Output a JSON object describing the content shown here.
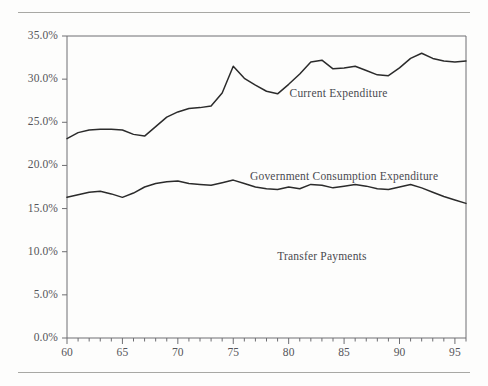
{
  "figure": {
    "background": "#fdfdfc",
    "rule_color": "#a8a8a4",
    "axis_color": "#6e6e72",
    "line_color": "#2b2b2b",
    "tick_label_color": "#55555a"
  },
  "chart_data": {
    "type": "line",
    "title": "",
    "subtitle": "",
    "xlabel": "",
    "ylabel": "",
    "xlim": [
      60,
      96
    ],
    "ylim": [
      0,
      35
    ],
    "grid": false,
    "legend": "inline-annotations",
    "y_tick_labels": [
      "0.0%",
      "5.0%",
      "10.0%",
      "15.0%",
      "20.0%",
      "25.0%",
      "30.0%",
      "35.0%"
    ],
    "y_tick_values": [
      0,
      5,
      10,
      15,
      20,
      25,
      30,
      35
    ],
    "x_tick_labels": [
      "60",
      "65",
      "70",
      "75",
      "80",
      "85",
      "90",
      "95"
    ],
    "x_tick_values": [
      60,
      65,
      70,
      75,
      80,
      85,
      90,
      95
    ],
    "x_minor_tick_step": 1,
    "x": [
      60,
      61,
      62,
      63,
      64,
      65,
      66,
      67,
      68,
      69,
      70,
      71,
      72,
      73,
      74,
      75,
      76,
      77,
      78,
      79,
      80,
      81,
      82,
      83,
      84,
      85,
      86,
      87,
      88,
      89,
      90,
      91,
      92,
      93,
      94,
      95,
      96
    ],
    "annotations": [
      {
        "text": "Current Expenditure",
        "x": 84.5,
        "y": 28.2
      },
      {
        "text": "Government Consumption Expenditure",
        "x": 85.0,
        "y": 18.6
      },
      {
        "text": "Transfer Payments",
        "x": 83.0,
        "y": 9.3
      }
    ],
    "series": [
      {
        "name": "Current Expenditure",
        "values": [
          23.1,
          23.8,
          24.1,
          24.2,
          24.2,
          24.1,
          23.6,
          23.4,
          24.5,
          25.6,
          26.2,
          26.6,
          26.7,
          26.9,
          28.4,
          31.5,
          30.1,
          29.3,
          28.6,
          28.3,
          29.4,
          30.6,
          32.0,
          32.2,
          31.2,
          31.3,
          31.5,
          31.0,
          30.5,
          30.4,
          31.3,
          32.4,
          33.0,
          32.4,
          32.1,
          32.0,
          32.1
        ]
      },
      {
        "name": "Government Consumption Expenditure",
        "values": [
          16.3,
          16.6,
          16.9,
          17.0,
          16.7,
          16.3,
          16.8,
          17.5,
          17.9,
          18.1,
          18.2,
          17.9,
          17.8,
          17.7,
          18.0,
          18.3,
          17.9,
          17.5,
          17.3,
          17.2,
          17.5,
          17.3,
          17.8,
          17.7,
          17.4,
          17.6,
          17.8,
          17.6,
          17.3,
          17.2,
          17.5,
          17.8,
          17.4,
          16.9,
          16.4,
          16.0,
          15.6
        ]
      }
    ]
  }
}
